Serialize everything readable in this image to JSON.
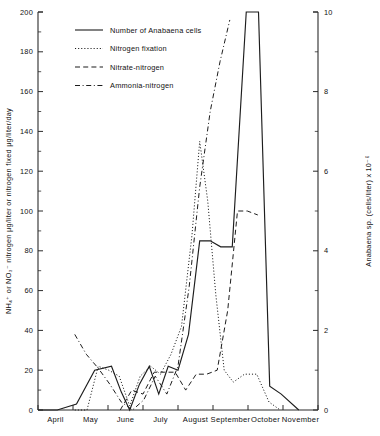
{
  "chart_data": {
    "type": "line",
    "title": "",
    "xlabel": "",
    "ylabel": "NH₄⁺ or NO₃⁻ nitrogen μg/liter or nitrogen fixed μg/liter/day",
    "ylabel_right": "Anabaena sp. (cells/liter) x 10⁻⁶",
    "ylim": [
      0,
      200
    ],
    "ylim_right": [
      0,
      10
    ],
    "ytick_step": 20,
    "ytick_minor_step": 10,
    "ytick_step_right": 2,
    "ytick_minor_step_right": 1,
    "grid": false,
    "legend_position": "upper-left-inside",
    "categories": [
      "April",
      "May",
      "June",
      "July",
      "August",
      "September",
      "October",
      "November"
    ],
    "yticks": [
      0,
      20,
      40,
      60,
      80,
      100,
      120,
      140,
      160,
      180,
      200
    ],
    "yticks_right": [
      0,
      2,
      4,
      6,
      8,
      10
    ],
    "series": [
      {
        "name": "Number of Anabaena cells",
        "style": "solid",
        "axis": "right",
        "x": [
          0.0,
          0.55,
          1.1,
          1.62,
          2.1,
          2.38,
          2.62,
          2.9,
          3.18,
          3.45,
          3.72,
          4.0,
          4.3,
          4.62,
          4.92,
          5.22,
          5.55,
          5.95,
          6.3,
          6.62,
          6.95,
          7.45
        ],
        "values_left_scale": [
          0,
          0,
          3,
          20,
          22,
          9,
          0,
          13,
          22,
          8,
          22,
          20,
          38,
          85,
          85,
          82,
          82,
          200,
          200,
          12,
          8,
          0
        ],
        "values": [
          0.0,
          0.0,
          0.15,
          1.0,
          1.1,
          0.45,
          0.0,
          0.65,
          1.1,
          0.4,
          1.1,
          1.0,
          1.9,
          4.25,
          4.25,
          4.1,
          4.1,
          10.0,
          10.0,
          0.6,
          0.4,
          0.0
        ]
      },
      {
        "name": "Nitrogen fixation",
        "style": "dotted",
        "axis": "left",
        "x": [
          1.05,
          1.4,
          1.72,
          2.02,
          2.32,
          2.62,
          2.92,
          3.22,
          3.5,
          3.8,
          4.1,
          4.4,
          4.62,
          4.85,
          5.08,
          5.32,
          5.58,
          5.9,
          6.25,
          6.6,
          6.92
        ],
        "values": [
          0,
          0,
          22,
          20,
          17,
          2,
          17,
          22,
          18,
          28,
          42,
          88,
          135,
          105,
          58,
          20,
          14,
          18,
          18,
          4,
          0
        ]
      },
      {
        "name": "Nitrate-nitrogen",
        "style": "dashed",
        "axis": "left",
        "x": [
          2.35,
          2.68,
          3.0,
          3.32,
          3.62,
          3.92,
          4.22,
          4.52,
          4.82,
          5.12,
          5.42,
          5.7,
          5.98,
          6.28
        ],
        "values": [
          0,
          10,
          8,
          19,
          19,
          19,
          10,
          18,
          18,
          20,
          50,
          100,
          100,
          98
        ]
      },
      {
        "name": "Ammonia-nitrogen",
        "style": "dashdot",
        "axis": "left",
        "x": [
          1.05,
          1.38,
          1.72,
          2.05,
          2.38,
          2.7,
          3.02,
          3.35,
          3.68,
          4.0,
          4.32,
          4.62,
          4.92,
          5.2,
          5.48
        ],
        "values": [
          38,
          28,
          21,
          13,
          4,
          0,
          5,
          17,
          8,
          22,
          62,
          112,
          150,
          175,
          196
        ]
      }
    ],
    "legend": [
      {
        "label": "Number of Anabaena cells",
        "style": "solid"
      },
      {
        "label": "Nitrogen fixation",
        "style": "dotted"
      },
      {
        "label": "Nitrate-nitrogen",
        "style": "dashed"
      },
      {
        "label": "Ammonia-nitrogen",
        "style": "dashdot"
      }
    ]
  }
}
